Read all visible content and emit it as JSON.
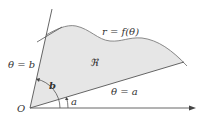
{
  "diagram": {
    "labels": {
      "curve": "r = f(θ)",
      "region": "ℜ",
      "ray_b": "θ = b",
      "ray_a": "θ = a",
      "angle_b": "b",
      "angle_a": "a",
      "origin": "O"
    },
    "colors": {
      "region_fill": "#e6e6e6",
      "curve_stroke": "#8a8a8a",
      "line_stroke": "#555555",
      "text": "#333333"
    }
  }
}
